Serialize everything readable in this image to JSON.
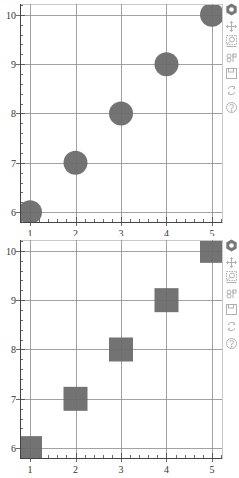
{
  "colors": {
    "marker": "#6b6b6b",
    "grid": "#8a8a8a",
    "frame": "#c8c8c8",
    "axis": "#444444",
    "tick_label": "#333333",
    "toolbar_icon": "#b0b0b0",
    "logo": "#777777"
  },
  "toolbar": {
    "tools": [
      {
        "name": "bokeh-logo",
        "label": "Bokeh"
      },
      {
        "name": "pan-tool",
        "label": "Pan"
      },
      {
        "name": "box-zoom-tool",
        "label": "Box Zoom"
      },
      {
        "name": "wheel-zoom-tool",
        "label": "Wheel Zoom"
      },
      {
        "name": "save-tool",
        "label": "Save"
      },
      {
        "name": "reset-tool",
        "label": "Reset"
      },
      {
        "name": "help-tool",
        "label": "Help"
      }
    ]
  },
  "chart_data": [
    {
      "type": "scatter",
      "marker": "circle",
      "title": "",
      "xlabel": "",
      "ylabel": "",
      "x": [
        1,
        2,
        3,
        4,
        5
      ],
      "y": [
        6,
        7,
        8,
        9,
        10
      ],
      "x_ticks": [
        "1",
        "2",
        "3",
        "4",
        "5"
      ],
      "y_ticks": [
        "6",
        "7",
        "8",
        "9",
        "10"
      ],
      "xlim": [
        0.78,
        5.22
      ],
      "ylim": [
        5.8,
        10.22
      ],
      "grid": true,
      "legend": null,
      "marker_size_px": 24
    },
    {
      "type": "scatter",
      "marker": "square",
      "title": "",
      "xlabel": "",
      "ylabel": "",
      "x": [
        1,
        2,
        3,
        4,
        5
      ],
      "y": [
        6,
        7,
        8,
        9,
        10
      ],
      "x_ticks": [
        "1",
        "2",
        "3",
        "4",
        "5"
      ],
      "y_ticks": [
        "6",
        "7",
        "8",
        "9",
        "10"
      ],
      "xlim": [
        0.78,
        5.22
      ],
      "ylim": [
        5.8,
        10.22
      ],
      "grid": true,
      "legend": null,
      "marker_size_px": 24
    }
  ]
}
